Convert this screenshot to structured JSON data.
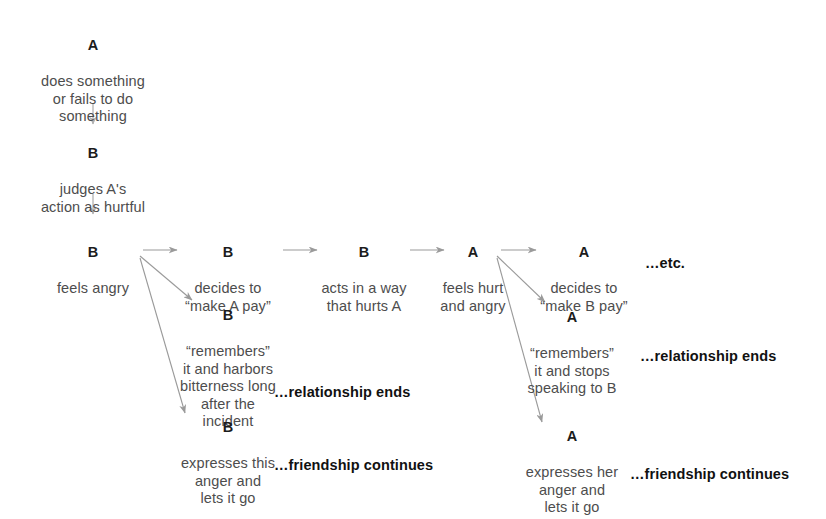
{
  "diagram": {
    "colors": {
      "actor_text": "#1c1c1c",
      "body_text": "#4d4d4d",
      "outcome_text": "#111111",
      "arrow": "#9a9a9a",
      "background": "#ffffff"
    },
    "nodes": [
      {
        "id": "a-does-something",
        "actor": "A",
        "text": "does something\nor fails to do\nsomething"
      },
      {
        "id": "b-judges",
        "actor": "B",
        "text": "judges A's\naction as hurtful"
      },
      {
        "id": "b-feels-angry",
        "actor": "B",
        "text": "feels angry"
      },
      {
        "id": "b-decides-make-a-pay",
        "actor": "B",
        "text": "decides to\n“make A pay”"
      },
      {
        "id": "b-acts-hurts-a",
        "actor": "B",
        "text": "acts in a way\nthat hurts A"
      },
      {
        "id": "a-feels-hurt",
        "actor": "A",
        "text": "feels hurt\nand angry"
      },
      {
        "id": "a-decides-make-b-pay",
        "actor": "A",
        "text": "decides to\n“make B pay”"
      },
      {
        "id": "b-remembers",
        "actor": "B",
        "text": "“remembers”\nit and harbors\nbitterness long\nafter the\nincident"
      },
      {
        "id": "a-remembers",
        "actor": "A",
        "text": "“remembers”\nit and stops\nspeaking to B"
      },
      {
        "id": "b-expresses",
        "actor": "B",
        "text": "expresses this\nanger and\nlets it go"
      },
      {
        "id": "a-expresses",
        "actor": "A",
        "text": "expresses her\nanger and\nlets it go"
      }
    ],
    "outcomes": [
      {
        "id": "etc",
        "text": "…etc."
      },
      {
        "id": "b-relationship-ends",
        "text": "…relationship ends"
      },
      {
        "id": "b-friendship-continues",
        "text": "…friendship continues"
      },
      {
        "id": "a-relationship-ends",
        "text": "…relationship ends"
      },
      {
        "id": "a-friendship-continues",
        "text": "…friendship continues"
      }
    ]
  }
}
